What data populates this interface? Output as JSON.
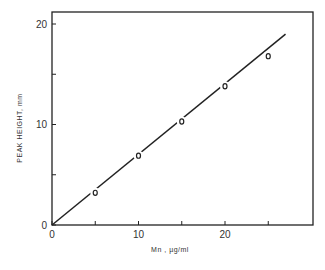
{
  "chart_data": {
    "type": "scatter",
    "title": "",
    "xlabel": "Mn , µg/ml",
    "ylabel": "PEAK HEIGHT, mm",
    "xlim": [
      0,
      30
    ],
    "ylim": [
      0,
      22
    ],
    "x_ticks": [
      0,
      5,
      10,
      15,
      20,
      25
    ],
    "x_tick_labels": [
      "0",
      "10",
      "20"
    ],
    "x_tick_label_values": [
      0,
      10,
      20
    ],
    "y_ticks": [
      0,
      5,
      10,
      15,
      20
    ],
    "y_tick_labels": [
      "0",
      "10",
      "20"
    ],
    "y_tick_label_values": [
      0,
      10,
      20
    ],
    "grid": false,
    "legend": null,
    "series": [
      {
        "name": "data points",
        "marker": "open-circle",
        "x": [
          5,
          10,
          15,
          20,
          25
        ],
        "y": [
          3.2,
          6.9,
          10.3,
          13.8,
          16.8
        ]
      },
      {
        "name": "fit line",
        "type": "line",
        "x": [
          0,
          27
        ],
        "y": [
          0,
          19
        ]
      }
    ],
    "extra_labels": {
      "origin_y_zero": "0",
      "origin_x_zero": "0"
    }
  },
  "colors": {
    "ink": "#222222",
    "background": "#ffffff"
  }
}
